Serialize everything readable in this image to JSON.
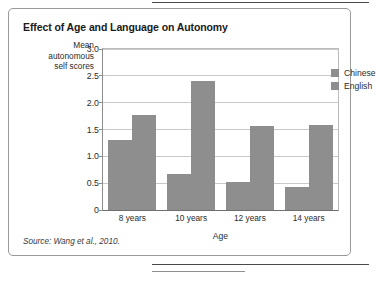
{
  "figure": {
    "title": "Effect of Age and Language on Autonomy",
    "source": "Source: Wang et al., 2010."
  },
  "chart_data": {
    "type": "bar",
    "title": "Effect of Age and Language on Autonomy",
    "xlabel": "Age",
    "ylabel": "Mean autonomous self scores",
    "ylabel_lines": [
      "Mean",
      "autonomous",
      "self scores"
    ],
    "categories": [
      "8 years",
      "10 years",
      "12 years",
      "14 years"
    ],
    "series": [
      {
        "name": "Chinese",
        "color": "#8e8e8e",
        "values": [
          1.3,
          0.68,
          0.52,
          0.42
        ]
      },
      {
        "name": "English",
        "color": "#8e8e8e",
        "values": [
          1.77,
          2.4,
          1.57,
          1.59
        ]
      }
    ],
    "ylim": [
      0,
      3.0
    ],
    "yticks": [
      0,
      0.5,
      1.0,
      1.5,
      2.0,
      2.5,
      3.0
    ],
    "ytick_labels": [
      "0",
      "0.5",
      "1.0",
      "1.5",
      "2.0",
      "2.5",
      "3.0"
    ],
    "grid": true,
    "legend_position": "top-right"
  }
}
